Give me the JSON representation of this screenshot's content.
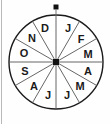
{
  "figure": {
    "type": "spinner-wheel",
    "background_color": "#fefefe",
    "outline_color": "#1a1a1a",
    "spoke_color": "#555555",
    "label_color": "#1a1a1a",
    "rule_color": "#b9b9b9"
  },
  "wheel": {
    "center_x": 56,
    "center_y": 62,
    "radius": 47,
    "sector_count": 12,
    "sector_degrees": 30,
    "sectors": [
      {
        "index": 0,
        "label": "J",
        "month": "January",
        "start_deg": 0,
        "end_deg": 30,
        "label_angle_deg": 15,
        "label_x": 68,
        "label_y": 28
      },
      {
        "index": 1,
        "label": "F",
        "month": "February",
        "start_deg": 30,
        "end_deg": 60,
        "label_angle_deg": 45,
        "label_x": 81,
        "label_y": 39
      },
      {
        "index": 2,
        "label": "M",
        "month": "March",
        "start_deg": 60,
        "end_deg": 90,
        "label_angle_deg": 75,
        "label_x": 88,
        "label_y": 54
      },
      {
        "index": 3,
        "label": "A",
        "month": "April",
        "start_deg": 90,
        "end_deg": 120,
        "label_angle_deg": 105,
        "label_x": 88,
        "label_y": 71
      },
      {
        "index": 4,
        "label": "M",
        "month": "May",
        "start_deg": 120,
        "end_deg": 150,
        "label_angle_deg": 135,
        "label_x": 80,
        "label_y": 86
      },
      {
        "index": 5,
        "label": "J",
        "month": "June",
        "start_deg": 150,
        "end_deg": 180,
        "label_angle_deg": 165,
        "label_x": 67,
        "label_y": 95
      },
      {
        "index": 6,
        "label": "J",
        "month": "July",
        "start_deg": 180,
        "end_deg": 210,
        "label_angle_deg": 195,
        "label_x": 48,
        "label_y": 95
      },
      {
        "index": 7,
        "label": "A",
        "month": "August",
        "start_deg": 210,
        "end_deg": 240,
        "label_angle_deg": 225,
        "label_x": 34,
        "label_y": 86
      },
      {
        "index": 8,
        "label": "S",
        "month": "September",
        "start_deg": 240,
        "end_deg": 270,
        "label_angle_deg": 255,
        "label_x": 25,
        "label_y": 71
      },
      {
        "index": 9,
        "label": "O",
        "month": "October",
        "start_deg": 270,
        "end_deg": 300,
        "label_angle_deg": 285,
        "label_x": 24,
        "label_y": 53
      },
      {
        "index": 10,
        "label": "N",
        "month": "November",
        "start_deg": 300,
        "end_deg": 330,
        "label_angle_deg": 315,
        "label_x": 32,
        "label_y": 38
      },
      {
        "index": 11,
        "label": "D",
        "month": "December",
        "start_deg": 330,
        "end_deg": 360,
        "label_angle_deg": 345,
        "label_x": 45,
        "label_y": 28
      }
    ]
  },
  "pointer": {
    "name": "top-pointer-dot",
    "x": 56,
    "y": 7,
    "size": 5
  },
  "hub": {
    "name": "center-hub",
    "x": 56,
    "y": 62,
    "size": 6
  }
}
